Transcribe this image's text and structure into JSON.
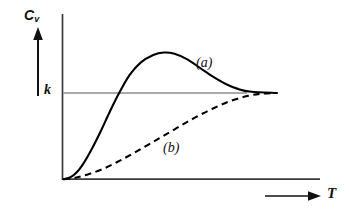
{
  "chart_data": {
    "type": "line",
    "title": "",
    "xlabel": "T",
    "ylabel": "C",
    "ylabel_subscript": "v",
    "xlabel_arrow": "arrow-right",
    "ylabel_arrow": "arrow-up",
    "reference_lines": [
      {
        "name": "k",
        "label": "k",
        "orientation": "horizontal",
        "value": 1.0,
        "color": "#555555",
        "x_start": 0.0,
        "x_end": 0.86
      }
    ],
    "axes": {
      "x_axis_visible": true,
      "y_axis_visible": true,
      "ticks": false,
      "grid": false,
      "xlim": [
        0,
        1
      ],
      "ylim": [
        0,
        1.62
      ],
      "axis_color": "#3a3a3a"
    },
    "series": [
      {
        "name": "(a)",
        "label": "(a)",
        "style": "solid",
        "color": "#000000",
        "description": "sigmoidal rise overshooting k then relaxing back to k",
        "annotation_position": {
          "x": 0.66,
          "y": 1.3
        },
        "points": [
          {
            "x": 0.0,
            "y": 0.0
          },
          {
            "x": 0.03,
            "y": 0.02
          },
          {
            "x": 0.06,
            "y": 0.075
          },
          {
            "x": 0.09,
            "y": 0.17
          },
          {
            "x": 0.13,
            "y": 0.34
          },
          {
            "x": 0.175,
            "y": 0.56
          },
          {
            "x": 0.22,
            "y": 0.8
          },
          {
            "x": 0.265,
            "y": 1.02
          },
          {
            "x": 0.31,
            "y": 1.21
          },
          {
            "x": 0.36,
            "y": 1.35
          },
          {
            "x": 0.42,
            "y": 1.44
          },
          {
            "x": 0.47,
            "y": 1.47
          },
          {
            "x": 0.52,
            "y": 1.455
          },
          {
            "x": 0.58,
            "y": 1.39
          },
          {
            "x": 0.64,
            "y": 1.29
          },
          {
            "x": 0.7,
            "y": 1.19
          },
          {
            "x": 0.76,
            "y": 1.105
          },
          {
            "x": 0.82,
            "y": 1.045
          },
          {
            "x": 0.88,
            "y": 1.015
          },
          {
            "x": 1.0,
            "y": 1.0
          }
        ]
      },
      {
        "name": "(b)",
        "label": "(b)",
        "style": "dashed",
        "color": "#000000",
        "description": "slow monotonic rise approaching k asymptotically",
        "annotation_position": {
          "x": 0.46,
          "y": 0.32
        },
        "points": [
          {
            "x": 0.0,
            "y": 0.0
          },
          {
            "x": 0.06,
            "y": 0.02
          },
          {
            "x": 0.12,
            "y": 0.06
          },
          {
            "x": 0.19,
            "y": 0.125
          },
          {
            "x": 0.26,
            "y": 0.21
          },
          {
            "x": 0.33,
            "y": 0.305
          },
          {
            "x": 0.4,
            "y": 0.405
          },
          {
            "x": 0.47,
            "y": 0.505
          },
          {
            "x": 0.545,
            "y": 0.615
          },
          {
            "x": 0.62,
            "y": 0.72
          },
          {
            "x": 0.7,
            "y": 0.82
          },
          {
            "x": 0.78,
            "y": 0.905
          },
          {
            "x": 0.86,
            "y": 0.965
          },
          {
            "x": 0.93,
            "y": 0.993
          },
          {
            "x": 1.0,
            "y": 1.0
          }
        ]
      }
    ]
  }
}
